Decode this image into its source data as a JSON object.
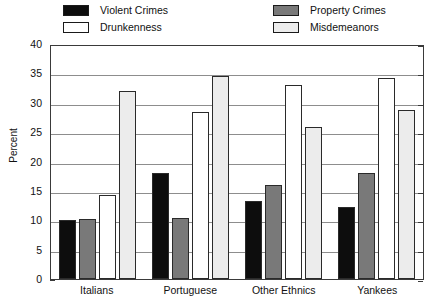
{
  "chart_data": {
    "type": "bar",
    "title": "",
    "xlabel": "",
    "ylabel": "Percent",
    "ylim": [
      0,
      40
    ],
    "yticks": [
      0,
      5,
      10,
      15,
      20,
      25,
      30,
      35,
      40
    ],
    "grid": true,
    "legend_position": "top",
    "categories": [
      "Italians",
      "Portuguese",
      "Other Ethnics",
      "Yankees"
    ],
    "series": [
      {
        "name": "Violent Crimes",
        "color": "#0d0d0d",
        "values": [
          10.0,
          18.0,
          13.3,
          12.2
        ]
      },
      {
        "name": "Property Crimes",
        "color": "#797979",
        "values": [
          10.2,
          10.4,
          16.0,
          18.0
        ]
      },
      {
        "name": "Drunkenness",
        "color": "#ffffff",
        "values": [
          14.3,
          28.5,
          33.0,
          34.2
        ]
      },
      {
        "name": "Misdemeanors",
        "color": "#ececec",
        "values": [
          32.0,
          34.5,
          25.8,
          28.8
        ]
      }
    ]
  },
  "legend": {
    "items": [
      {
        "label": "Violent Crimes",
        "color": "#0d0d0d"
      },
      {
        "label": "Drunkenness",
        "color": "#ffffff"
      },
      {
        "label": "Property Crimes",
        "color": "#797979"
      },
      {
        "label": "Misdemeanors",
        "color": "#ececec"
      }
    ]
  },
  "axis": {
    "y_title": "Percent",
    "y_tick_labels": [
      "40",
      "35",
      "30",
      "25",
      "20",
      "15",
      "10",
      "5",
      "0"
    ],
    "x_tick_labels": [
      "Italians",
      "Portuguese",
      "Other Ethnics",
      "Yankees"
    ]
  }
}
